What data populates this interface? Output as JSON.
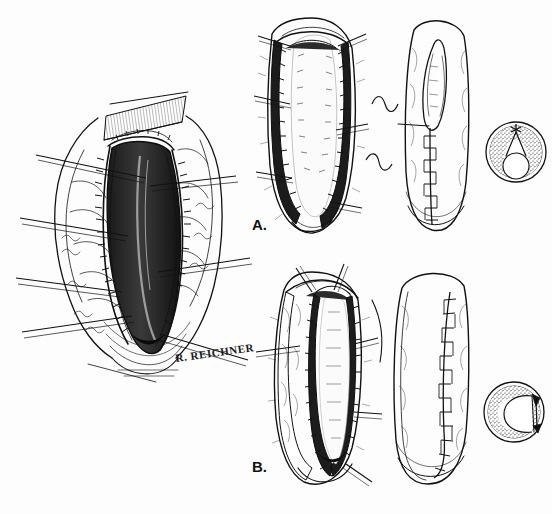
{
  "figure": {
    "medium": "pen-and-ink line drawing",
    "background_color": "#fdfdfd",
    "ink_color": "#111111",
    "width": 552,
    "height": 514,
    "signature": "R. REICHNER"
  },
  "panels": [
    {
      "id": "overview",
      "label": "",
      "caption": "Operative field: open longitudinal incision held apart by stay sutures",
      "parts": [
        {
          "name": "open-wound-cavity",
          "description": "deep midline cleft with dark shadowed lumen"
        },
        {
          "name": "wound-edge-left",
          "description": "everted stippled margin, left"
        },
        {
          "name": "wound-edge-right",
          "description": "everted stippled margin, right"
        },
        {
          "name": "hatched-tissue-block-superior",
          "description": "densely hatched block of tissue at superior pole"
        },
        {
          "name": "stay-sutures",
          "count": 7,
          "description": "straight retraction sutures radiating outward"
        }
      ]
    },
    {
      "id": "A",
      "label": "A.",
      "caption": "Midline closure: incision approximated in the median plane",
      "figures": [
        {
          "name": "open-incision",
          "description": "open elliptical incision, both edges sutured, held open by six stay sutures"
        },
        {
          "name": "closure-progress",
          "description": "tubularized segment, upper lens-shaped defect still open, running midline suture line below"
        },
        {
          "name": "cross-section",
          "description": "circular cross-section, stippled wall, central lumen, closure apex at top (12 o'clock)",
          "closure_position": "top",
          "lumen_shape": "circular"
        }
      ],
      "connectors": [
        "brace-upper",
        "brace-lower"
      ]
    },
    {
      "id": "B",
      "label": "B.",
      "caption": "Lateral closure: incision approximated off the midline",
      "figures": [
        {
          "name": "open-incision",
          "description": "obliquely opened incision with asymmetric flap, stay sutures on left and right"
        },
        {
          "name": "closure-progress",
          "description": "fully tubularized segment with the running suture line displaced laterally to the right"
        },
        {
          "name": "cross-section",
          "description": "C-shaped stippled wall with closure seam at the right side (3 o'clock)",
          "closure_position": "right",
          "lumen_shape": "C-shaped"
        }
      ],
      "connectors": [
        "lead-line"
      ]
    }
  ],
  "labels": {
    "panel_a": "A.",
    "panel_b": "B.",
    "artist_signature": "R. REICHNER"
  }
}
